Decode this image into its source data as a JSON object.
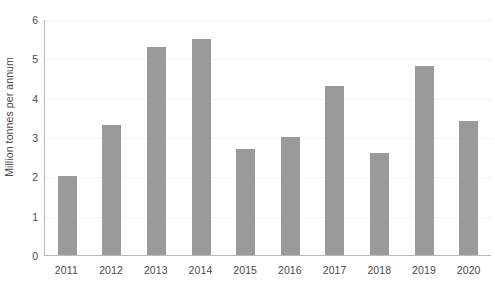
{
  "chart_data": {
    "type": "bar",
    "title": "",
    "subtitle": "",
    "xlabel": "",
    "ylabel": "Million tonnes per annum",
    "categories": [
      "2011",
      "2012",
      "2013",
      "2014",
      "2015",
      "2016",
      "2017",
      "2018",
      "2019",
      "2020"
    ],
    "values": [
      2.0,
      3.3,
      5.3,
      5.5,
      2.7,
      3.0,
      4.3,
      2.6,
      4.8,
      3.4
    ],
    "series": [
      {
        "name": "Million tonnes per annum",
        "values": [
          2.0,
          3.3,
          5.3,
          5.5,
          2.7,
          3.0,
          4.3,
          2.6,
          4.8,
          3.4
        ]
      }
    ],
    "ylim": [
      0,
      6
    ],
    "yticks": [
      0,
      1,
      2,
      3,
      4,
      5,
      6
    ],
    "ytick_labels": [
      "0",
      "1",
      "2",
      "3",
      "4",
      "5",
      "6"
    ],
    "grid": true,
    "grid_axis": "y",
    "legend": false,
    "legend_position": "none",
    "annotations": [],
    "bar_color": "#9a9a9a",
    "axis_color": "#b8b8b8",
    "gridline_color": "#f4f4f4",
    "text_color": "#4a4a4a",
    "background_color": "#ffffff"
  }
}
